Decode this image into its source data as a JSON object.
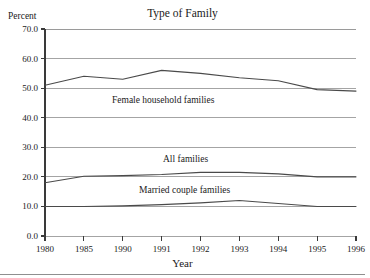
{
  "chart_data": {
    "type": "line",
    "title": "Type of Family",
    "xlabel": "Year",
    "ylabel": "Percent",
    "x": [
      1980,
      1985,
      1990,
      1991,
      1992,
      1993,
      1994,
      1995,
      1996
    ],
    "xticklabels": [
      "1980",
      "1985",
      "1990",
      "1991",
      "1992",
      "1993",
      "1994",
      "1995",
      "1996"
    ],
    "yticklabels": [
      "0.0",
      "10.0",
      "20.0",
      "30.0",
      "40.0",
      "50.0",
      "60.0",
      "70.0"
    ],
    "yticks": [
      0,
      10,
      20,
      30,
      40,
      50,
      60,
      70
    ],
    "ylim": [
      0,
      70
    ],
    "grid": "horizontal",
    "legend": "inline-annotations",
    "line_color": "#4a4a4a",
    "grid_color": "#9a9a9a",
    "axis_color": "#3a3a3a",
    "series": [
      {
        "name": "Female household families",
        "values": [
          51.0,
          54.0,
          53.0,
          56.0,
          55.0,
          53.5,
          52.5,
          49.5,
          49.0
        ]
      },
      {
        "name": "All families",
        "values": [
          18.0,
          20.2,
          20.4,
          20.8,
          21.5,
          21.5,
          21.0,
          20.0,
          20.0
        ]
      },
      {
        "name": "Married couple families",
        "values": [
          10.0,
          10.0,
          10.2,
          10.6,
          11.2,
          12.0,
          11.0,
          10.0,
          10.0
        ]
      }
    ]
  }
}
